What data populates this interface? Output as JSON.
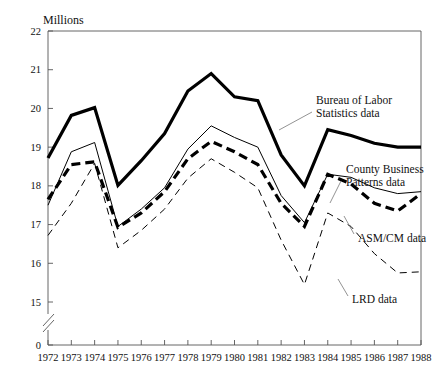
{
  "chart_data": {
    "type": "line",
    "title": "",
    "unit_label": "Millions",
    "xlabel": "",
    "ylabel": "Millions",
    "grid": false,
    "legend_position": "inline-annotations",
    "axis_break": true,
    "xlim": [
      1972,
      1988
    ],
    "ylim": [
      15,
      22
    ],
    "yticks": [
      "0",
      "15",
      "16",
      "17",
      "18",
      "19",
      "20",
      "21",
      "22"
    ],
    "x": [
      1972,
      1973,
      1974,
      1975,
      1976,
      1977,
      1978,
      1979,
      1980,
      1981,
      1982,
      1983,
      1984,
      1985,
      1986,
      1987,
      1988
    ],
    "xticklabels": [
      "1972",
      "1973",
      "1974",
      "1975",
      "1976",
      "1977",
      "1978",
      "1979",
      "1980",
      "1981",
      "1982",
      "1983",
      "1984",
      "1985",
      "1986",
      "1987",
      "1988"
    ],
    "series": [
      {
        "name": "Bureau of Labor Statistics data",
        "style": "solid-thick",
        "values": [
          18.72,
          19.82,
          20.02,
          18.01,
          18.65,
          19.35,
          20.45,
          20.9,
          20.3,
          20.2,
          18.8,
          18.0,
          19.45,
          19.3,
          19.1,
          19.0,
          19.0
        ]
      },
      {
        "name": "County Business Patterns data",
        "style": "solid-thin",
        "values": [
          17.5,
          18.88,
          19.12,
          16.95,
          17.4,
          17.95,
          18.95,
          19.55,
          19.25,
          19.0,
          17.75,
          17.05,
          18.3,
          18.22,
          17.95,
          17.8,
          17.85
        ]
      },
      {
        "name": "ASM/CM data",
        "style": "dashed-thick",
        "values": [
          17.65,
          18.55,
          18.62,
          16.93,
          17.3,
          17.85,
          18.7,
          19.15,
          18.88,
          18.55,
          17.55,
          16.95,
          18.3,
          18.05,
          17.55,
          17.35,
          17.8
        ]
      },
      {
        "name": "LRD data",
        "style": "dashed-thin",
        "values": [
          16.72,
          17.55,
          18.58,
          16.4,
          16.85,
          17.4,
          18.2,
          18.7,
          18.35,
          17.95,
          16.6,
          15.45,
          17.3,
          16.95,
          16.25,
          15.75,
          15.78
        ]
      }
    ],
    "annotations": [
      {
        "name": "bls-label",
        "text_lines": [
          "Bureau of Labor",
          "Statistics data"
        ]
      },
      {
        "name": "cbp-label",
        "text_lines": [
          "County Business",
          "Patterns data"
        ]
      },
      {
        "name": "asmcm-label",
        "text_lines": [
          "ASM/CM data"
        ]
      },
      {
        "name": "lrd-label",
        "text_lines": [
          "LRD data"
        ]
      }
    ]
  }
}
